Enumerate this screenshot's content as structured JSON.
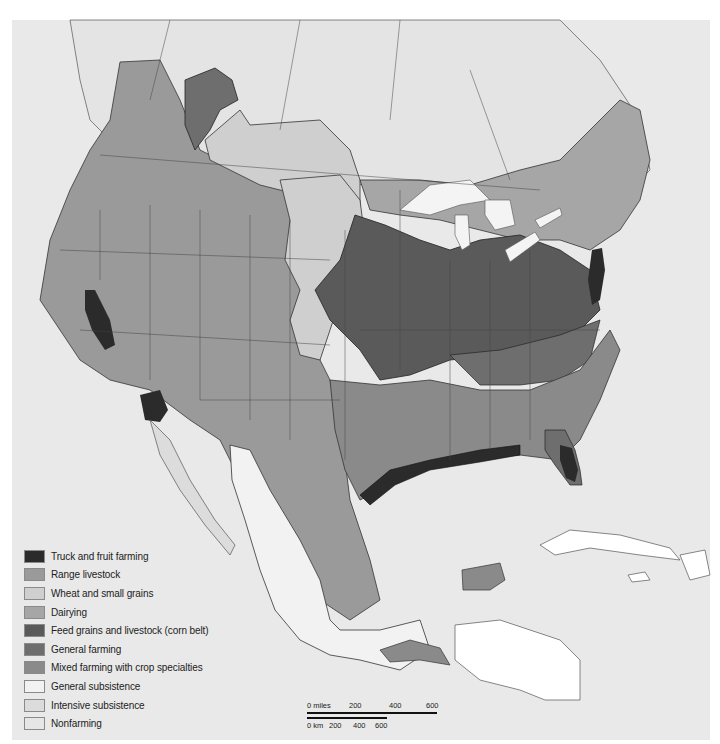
{
  "map": {
    "subject": "Agricultural regions of North America",
    "colors": {
      "background": "#ffffff",
      "ocean": "#e9e9e9",
      "border_line": "#3a3a3a",
      "water_lakes": "#f4f4f4"
    }
  },
  "legend": {
    "items": [
      {
        "label": "Truck and fruit farming",
        "color": "#2b2b2b"
      },
      {
        "label": "Range livestock",
        "color": "#9a9a9a"
      },
      {
        "label": "Wheat and small grains",
        "color": "#cfcfcf"
      },
      {
        "label": "Dairying",
        "color": "#a6a6a6"
      },
      {
        "label": "Feed grains and livestock (corn belt)",
        "color": "#5a5a5a"
      },
      {
        "label": "General farming",
        "color": "#6e6e6e"
      },
      {
        "label": "Mixed farming with crop specialties",
        "color": "#8a8a8a"
      },
      {
        "label": "General subsistence",
        "color": "#f2f2f2"
      },
      {
        "label": "Intensive subsistence",
        "color": "#dcdcdc"
      },
      {
        "label": "Nonfarming",
        "color": "#e6e6e6"
      }
    ]
  },
  "scale_bar": {
    "miles_labels": [
      "0 miles",
      "200",
      "400",
      "600"
    ],
    "km_labels": [
      "0 km",
      "200",
      "400",
      "600"
    ]
  }
}
